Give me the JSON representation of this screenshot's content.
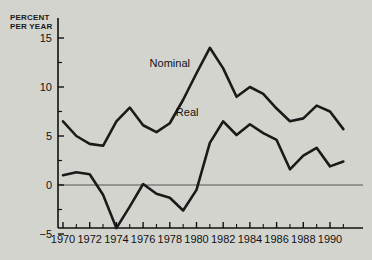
{
  "chart_data": {
    "type": "line",
    "title": "",
    "subtitle": "",
    "xlabel": "",
    "ylabel": "PERCENT\nPER YEAR",
    "xlim": [
      1969.4,
      1991.2
    ],
    "ylim": [
      -5,
      15
    ],
    "yticks": [
      -5,
      0,
      5,
      10,
      15
    ],
    "ytick_labels": [
      "-5",
      "0",
      "5",
      "10",
      "15"
    ],
    "yminor_ticks": [
      -2.5,
      2.5,
      7.5,
      12.5
    ],
    "xticks": [
      1970,
      1971,
      1972,
      1973,
      1974,
      1975,
      1976,
      1977,
      1978,
      1979,
      1980,
      1981,
      1982,
      1983,
      1984,
      1985,
      1986,
      1987,
      1988,
      1989,
      1990,
      1991
    ],
    "xtick_labels_shown": [
      "1970",
      "1972",
      "1974",
      "1976",
      "1978",
      "1980",
      "1982",
      "1984",
      "1986",
      "1988",
      "1990"
    ],
    "grid": false,
    "zero_line": true,
    "legend_position": "inline-annotations",
    "x": [
      1970,
      1971,
      1972,
      1973,
      1974,
      1975,
      1976,
      1977,
      1978,
      1979,
      1980,
      1981,
      1982,
      1983,
      1984,
      1985,
      1986,
      1987,
      1988,
      1989,
      1990,
      1991
    ],
    "series": [
      {
        "name": "Nominal",
        "label_x": 1978.0,
        "label_y": 12.4,
        "color": "#1a1a1a",
        "values": [
          6.5,
          5.0,
          4.2,
          4.0,
          6.5,
          7.9,
          6.1,
          5.4,
          6.3,
          8.7,
          11.4,
          14.0,
          11.9,
          9.0,
          10.0,
          9.3,
          7.8,
          6.5,
          6.8,
          8.1,
          7.5,
          5.7
        ]
      },
      {
        "name": "Real",
        "label_x": 1979.3,
        "label_y": 7.5,
        "color": "#1a1a1a",
        "values": [
          1.0,
          1.3,
          1.1,
          -1.0,
          -4.4,
          -2.2,
          0.1,
          -0.9,
          -1.3,
          -2.6,
          -0.5,
          4.3,
          6.5,
          5.1,
          6.2,
          5.3,
          4.6,
          1.6,
          3.0,
          3.8,
          1.9,
          2.4
        ]
      }
    ]
  },
  "axis": {
    "ylabel_line1": "PERCENT",
    "ylabel_line2": "PER YEAR"
  }
}
